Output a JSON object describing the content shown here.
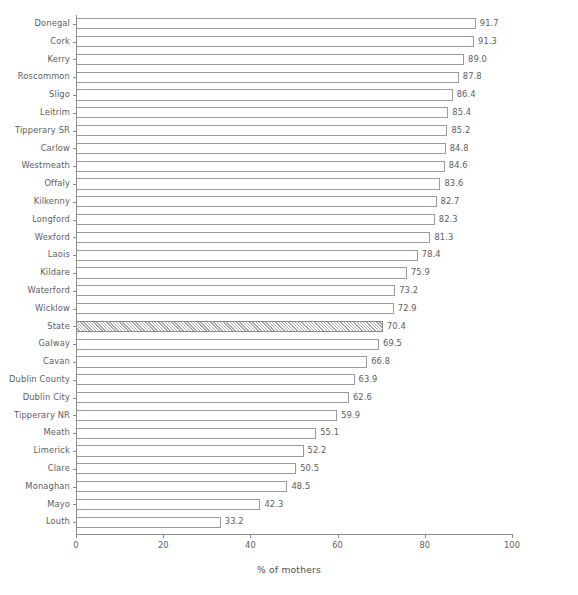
{
  "chart_data": {
    "type": "bar",
    "orientation": "horizontal",
    "title": "",
    "xlabel": "% of mothers",
    "ylabel": "",
    "xlim": [
      0,
      100
    ],
    "xticks": [
      0,
      20,
      40,
      60,
      80,
      100
    ],
    "xtick_labels": [
      "0",
      "20",
      "40",
      "60",
      "80",
      "100"
    ],
    "grid": false,
    "legend": null,
    "categories": [
      "Donegal",
      "Cork",
      "Kerry",
      "Roscommon",
      "Sligo",
      "Leitrim",
      "Tipperary SR",
      "Carlow",
      "Westmeath",
      "Offaly",
      "Kilkenny",
      "Longford",
      "Wexford",
      "Laois",
      "Kildare",
      "Waterford",
      "Wicklow",
      "State",
      "Galway",
      "Cavan",
      "Dublin County",
      "Dublin City",
      "Tipperary NR",
      "Meath",
      "Limerick",
      "Clare",
      "Monaghan",
      "Mayo",
      "Louth"
    ],
    "values": [
      91.7,
      91.3,
      89.0,
      87.8,
      86.4,
      85.4,
      85.2,
      84.8,
      84.6,
      83.6,
      82.7,
      82.3,
      81.3,
      78.4,
      75.9,
      73.2,
      72.9,
      70.4,
      69.5,
      66.8,
      63.9,
      62.6,
      59.9,
      55.1,
      52.2,
      50.5,
      48.5,
      42.3,
      33.2
    ],
    "value_labels": [
      "91.7",
      "91.3",
      "89.0",
      "87.8",
      "86.4",
      "85.4",
      "85.2",
      "84.8",
      "84.6",
      "83.6",
      "82.7",
      "82.3",
      "81.3",
      "78.4",
      "75.9",
      "73.2",
      "72.9",
      "70.4",
      "69.5",
      "66.8",
      "63.9",
      "62.6",
      "59.9",
      "55.1",
      "52.2",
      "50.5",
      "48.5",
      "42.3",
      "33.2"
    ],
    "highlighted_category": "State",
    "highlight_style": "diagonal-hatch",
    "bar_fill_color": "#ffffff",
    "bar_edge_color": "#9b9b9b",
    "hatch_color": "#a8a8a8",
    "axis_color": "#8c8c8c",
    "text_color": "#5e5e5e"
  }
}
